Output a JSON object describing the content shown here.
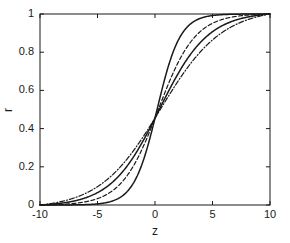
{
  "chart_data": {
    "type": "line",
    "title": "",
    "subtitle": "",
    "xlabel": "z",
    "ylabel": "r",
    "xlim": [
      -10,
      10
    ],
    "ylim": [
      0,
      1
    ],
    "xticks": [
      -10,
      -5,
      0,
      5,
      10
    ],
    "xtick_labels": [
      "-10",
      "-5",
      "0",
      "5",
      "10"
    ],
    "yticks": [
      0,
      0.2,
      0.4,
      0.6,
      0.8,
      1
    ],
    "ytick_labels": [
      "0",
      "0.2",
      "0.4",
      "0.6",
      "0.8",
      "1"
    ],
    "grid": false,
    "legend": null,
    "legend_position": "none",
    "x": [
      -10,
      -9,
      -8,
      -7,
      -6,
      -5,
      -4,
      -3,
      -2,
      -1,
      0,
      1,
      2,
      3,
      4,
      5,
      6,
      7,
      8,
      9,
      10
    ],
    "series": [
      {
        "name": "curve-1",
        "style": "solid",
        "color": "#1a1a1a",
        "steepness": 1.0,
        "midpoint": 0.2,
        "offset": 0.455,
        "values": [
          0.0,
          0.001,
          0.002,
          0.004,
          0.011,
          0.027,
          0.066,
          0.145,
          0.275,
          0.422,
          0.455,
          0.72,
          0.88,
          0.955,
          0.984,
          0.995,
          0.998,
          0.999,
          1.0,
          1.0,
          1.0
        ]
      },
      {
        "name": "curve-2",
        "style": "dashed",
        "color": "#1a1a1a",
        "steepness": 0.62,
        "midpoint": 0.25,
        "offset": 0.455,
        "values": [
          0.005,
          0.009,
          0.016,
          0.029,
          0.051,
          0.086,
          0.141,
          0.221,
          0.325,
          0.42,
          0.455,
          0.655,
          0.8,
          0.894,
          0.947,
          0.975,
          0.988,
          0.995,
          0.998,
          0.999,
          1.0
        ]
      },
      {
        "name": "curve-3",
        "style": "solid",
        "color": "#1a1a1a",
        "steepness": 0.47,
        "midpoint": 0.3,
        "offset": 0.455,
        "values": [
          0.012,
          0.02,
          0.032,
          0.05,
          0.077,
          0.116,
          0.17,
          0.242,
          0.326,
          0.408,
          0.455,
          0.6,
          0.73,
          0.835,
          0.905,
          0.948,
          0.972,
          0.985,
          0.993,
          0.997,
          1.0
        ]
      },
      {
        "name": "curve-4",
        "style": "dashdot",
        "color": "#1a1a1a",
        "steepness": 0.37,
        "midpoint": 0.35,
        "offset": 0.455,
        "values": [
          0.028,
          0.04,
          0.057,
          0.08,
          0.111,
          0.152,
          0.204,
          0.267,
          0.339,
          0.403,
          0.455,
          0.565,
          0.676,
          0.776,
          0.853,
          0.908,
          0.945,
          0.968,
          0.982,
          0.991,
          1.0
        ]
      }
    ],
    "axis_color": "#1a1a1a",
    "background_color": "#ffffff"
  },
  "plot_box": {
    "left": 40,
    "top": 14,
    "right": 270,
    "bottom": 205
  }
}
